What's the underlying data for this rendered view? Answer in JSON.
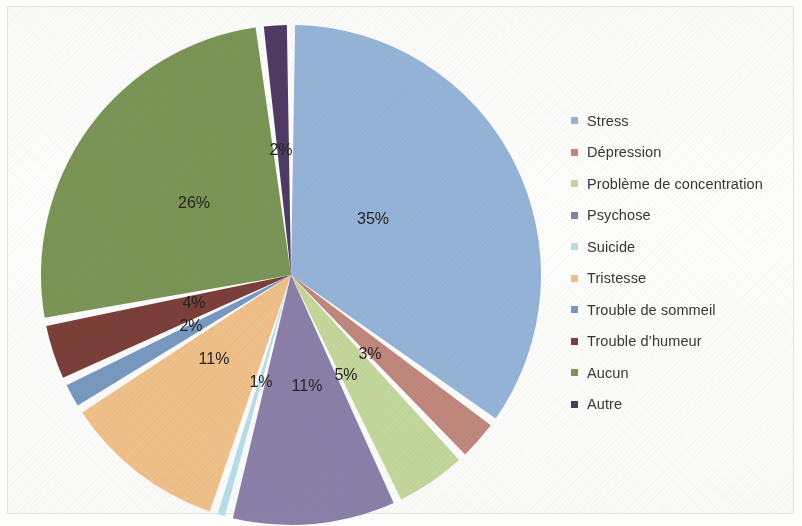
{
  "figure": {
    "background_color": "#fdfdfc",
    "border_color": "#e2e2e0"
  },
  "legend": {
    "position": "right",
    "items": [
      {
        "label": "Stress",
        "color": "#95b3d7"
      },
      {
        "label": "Dépression",
        "color": "#c0877d"
      },
      {
        "label": "Problème de concentration",
        "color": "#c3d69b"
      },
      {
        "label": "Psychose",
        "color": "#8a7fa8"
      },
      {
        "label": "Suicide",
        "color": "#b7dde8"
      },
      {
        "label": "Tristesse",
        "color": "#f0c08a"
      },
      {
        "label": "Trouble de sommeil",
        "color": "#7798c0"
      },
      {
        "label": "Trouble d’humeur",
        "color": "#7b3f3a"
      },
      {
        "label": "Aucun",
        "color": "#7a9456"
      },
      {
        "label": "Autre",
        "color": "#4d3b63"
      }
    ]
  },
  "chart_data": {
    "type": "pie",
    "title": "",
    "xlabel": "",
    "ylabel": "",
    "grid": false,
    "legend_position": "right",
    "start_angle_deg": 0,
    "direction": "clockwise",
    "categories": [
      "Stress",
      "Dépression",
      "Problème de concentration",
      "Psychose",
      "Suicide",
      "Tristesse",
      "Trouble de sommeil",
      "Trouble d’humeur",
      "Aucun",
      "Autre"
    ],
    "values": [
      35,
      3,
      5,
      11,
      1,
      11,
      2,
      4,
      26,
      2
    ],
    "colors": [
      "#95b3d7",
      "#c0877d",
      "#c3d69b",
      "#8a7fa8",
      "#b7dde8",
      "#f0c08a",
      "#7798c0",
      "#7b3f3a",
      "#7a9456",
      "#4d3b63"
    ],
    "data_labels": [
      "35%",
      "3%",
      "5%",
      "11%",
      "1%",
      "11%",
      "2%",
      "4%",
      "26%",
      "2%"
    ],
    "label_format": "percent",
    "slice_gap": true
  },
  "slice_labels": {
    "stress": "35%",
    "depression": "3%",
    "concentration": "5%",
    "psychose": "11%",
    "suicide": "1%",
    "tristesse": "11%",
    "sommeil": "2%",
    "humeur": "4%",
    "aucun": "26%",
    "autre": "2%"
  }
}
